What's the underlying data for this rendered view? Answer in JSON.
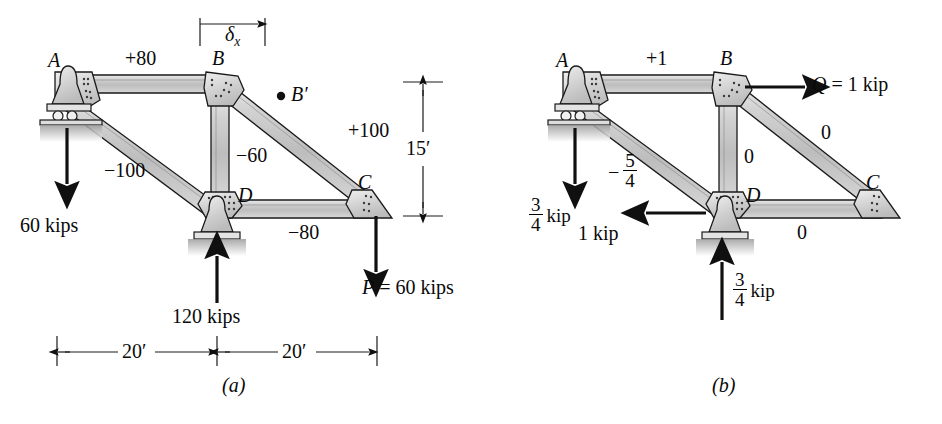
{
  "figure": {
    "type": "engineering-truss-diagram",
    "panels": [
      {
        "id": "a",
        "caption": "(a)",
        "description": "Truss with real loads and member forces in kips",
        "joints": [
          {
            "name": "A",
            "label": "A",
            "support": "roller"
          },
          {
            "name": "B",
            "label": "B",
            "support": "none"
          },
          {
            "name": "C",
            "label": "C",
            "support": "none"
          },
          {
            "name": "D",
            "label": "D",
            "support": "pin"
          },
          {
            "name": "Bprime",
            "label": "B′",
            "support": "none"
          }
        ],
        "member_forces": [
          {
            "member": "AB",
            "label": "+80"
          },
          {
            "member": "AD",
            "label": "−100"
          },
          {
            "member": "BD",
            "label": "−60"
          },
          {
            "member": "BC",
            "label": "+100"
          },
          {
            "member": "DC",
            "label": "−80"
          }
        ],
        "loads": [
          {
            "name": "load-at-A",
            "label": "60 kips",
            "direction": "down"
          },
          {
            "name": "reaction-at-D",
            "label": "120 kips",
            "direction": "up"
          },
          {
            "name": "load-at-C",
            "label": "P = 60 kips",
            "direction": "down"
          }
        ],
        "dimensions": [
          {
            "name": "deflection",
            "label": "δ",
            "sub": "x"
          },
          {
            "name": "height",
            "label": "15′"
          },
          {
            "name": "span-left",
            "label": "20′"
          },
          {
            "name": "span-right",
            "label": "20′"
          }
        ]
      },
      {
        "id": "b",
        "caption": "(b)",
        "description": "Truss with virtual unit load and resulting member forces",
        "joints": [
          {
            "name": "A",
            "label": "A",
            "support": "roller"
          },
          {
            "name": "B",
            "label": "B",
            "support": "none"
          },
          {
            "name": "C",
            "label": "C",
            "support": "none"
          },
          {
            "name": "D",
            "label": "D",
            "support": "pin"
          }
        ],
        "member_forces": [
          {
            "member": "AB",
            "label": "+1"
          },
          {
            "member": "AD",
            "label": "−5/4",
            "numerator": "5",
            "denominator": "4",
            "sign": "−"
          },
          {
            "member": "BD",
            "label": "0"
          },
          {
            "member": "BC",
            "label": "0"
          },
          {
            "member": "DC",
            "label": "0"
          }
        ],
        "loads": [
          {
            "name": "virtual-load-at-B",
            "label": "Q = 1 kip",
            "symbol": "Q",
            "equals": "= 1 kip",
            "direction": "right"
          },
          {
            "name": "reaction-at-A",
            "numerator": "3",
            "denominator": "4",
            "unit": "kip",
            "direction": "down"
          },
          {
            "name": "reaction-at-D-horizontal",
            "label": "1 kip",
            "direction": "left"
          },
          {
            "name": "reaction-at-D-vertical",
            "numerator": "3",
            "denominator": "4",
            "unit": "kip",
            "direction": "up"
          }
        ]
      }
    ],
    "colors": {
      "member_fill": "#c9c9c9",
      "member_fill_light": "#e2e2e2",
      "gusset_fill": "#d6d6d6",
      "ground_hatch": "#b5b5b5",
      "line": "#1a1a1a",
      "background": "#ffffff"
    }
  }
}
